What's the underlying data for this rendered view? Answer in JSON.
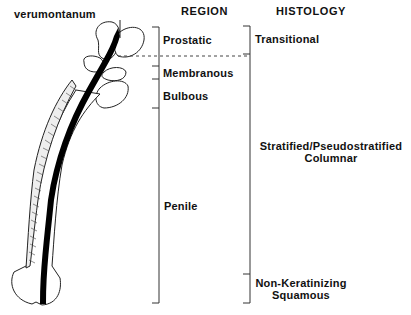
{
  "figure": {
    "anatomy_label": "verumontanum",
    "headers": {
      "region": "REGION",
      "histology": "HISTOLOGY"
    },
    "regions": [
      {
        "label": "Prostatic"
      },
      {
        "label": "Membranous"
      },
      {
        "label": "Bulbous"
      },
      {
        "label": "Penile"
      }
    ],
    "histology": [
      {
        "line1": "Transitional",
        "line2": ""
      },
      {
        "line1": "Stratified/Pseudostratified",
        "line2": "Columnar"
      },
      {
        "line1": "Non-Keratinizing",
        "line2": "Squamous"
      }
    ],
    "colors": {
      "ink": "#111111",
      "background": "#ffffff"
    }
  }
}
